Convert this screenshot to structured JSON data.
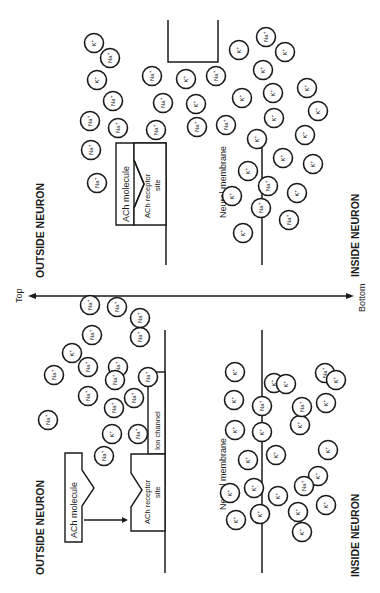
{
  "axis": {
    "top_label": "Top",
    "bottom_label": "Bottom"
  },
  "panel_closed": {
    "outside_label": "OUTSIDE NEURON",
    "inside_label": "INSIDE NEURON",
    "ach_molecule_label": "ACh molecule",
    "receptor_label_line1": "ACh receptor",
    "receptor_label_line2": "site",
    "ion_channel_label": "Ion channel",
    "membrane_label": "Neural membrane",
    "ions": [
      {
        "x": 48,
        "y": 420,
        "t": "Na"
      },
      {
        "x": 54,
        "y": 375,
        "t": "Na"
      },
      {
        "x": 72,
        "y": 353,
        "t": "K"
      },
      {
        "x": 88,
        "y": 396,
        "t": "Na"
      },
      {
        "x": 92,
        "y": 335,
        "t": "Na"
      },
      {
        "x": 117,
        "y": 307,
        "t": "Na"
      },
      {
        "x": 104,
        "y": 456,
        "t": "Na"
      },
      {
        "x": 112,
        "y": 434,
        "t": "K"
      },
      {
        "x": 114,
        "y": 408,
        "t": "Na"
      },
      {
        "x": 118,
        "y": 367,
        "t": "Na"
      },
      {
        "x": 90,
        "y": 305,
        "t": "Na"
      },
      {
        "x": 134,
        "y": 398,
        "t": "Na"
      },
      {
        "x": 138,
        "y": 434,
        "t": "Na"
      },
      {
        "x": 140,
        "y": 337,
        "t": "Na"
      },
      {
        "x": 115,
        "y": 380,
        "t": "Na"
      },
      {
        "x": 88,
        "y": 367,
        "t": "Na"
      },
      {
        "x": 140,
        "y": 318,
        "t": "Na"
      },
      {
        "x": 148,
        "y": 377,
        "t": "Na"
      },
      {
        "x": 235,
        "y": 372,
        "t": "K"
      },
      {
        "x": 234,
        "y": 400,
        "t": "K"
      },
      {
        "x": 262,
        "y": 406,
        "t": "Na"
      },
      {
        "x": 274,
        "y": 383,
        "t": "K"
      },
      {
        "x": 286,
        "y": 384,
        "t": "K"
      },
      {
        "x": 235,
        "y": 430,
        "t": "K"
      },
      {
        "x": 248,
        "y": 460,
        "t": "K"
      },
      {
        "x": 262,
        "y": 432,
        "t": "K"
      },
      {
        "x": 276,
        "y": 455,
        "t": "K"
      },
      {
        "x": 300,
        "y": 425,
        "t": "K"
      },
      {
        "x": 302,
        "y": 407,
        "t": "Na"
      },
      {
        "x": 325,
        "y": 373,
        "t": "Na"
      },
      {
        "x": 326,
        "y": 403,
        "t": "K"
      },
      {
        "x": 336,
        "y": 380,
        "t": "K"
      },
      {
        "x": 328,
        "y": 450,
        "t": "K"
      },
      {
        "x": 318,
        "y": 476,
        "t": "K"
      },
      {
        "x": 326,
        "y": 505,
        "t": "K"
      },
      {
        "x": 298,
        "y": 512,
        "t": "K"
      },
      {
        "x": 304,
        "y": 486,
        "t": "Na"
      },
      {
        "x": 278,
        "y": 496,
        "t": "K"
      },
      {
        "x": 260,
        "y": 514,
        "t": "K"
      },
      {
        "x": 254,
        "y": 488,
        "t": "K"
      },
      {
        "x": 236,
        "y": 520,
        "t": "K"
      },
      {
        "x": 230,
        "y": 493,
        "t": "K"
      },
      {
        "x": 302,
        "y": 532,
        "t": "K"
      }
    ]
  },
  "panel_open": {
    "outside_label": "OUTSIDE NEURON",
    "inside_label": "INSIDE NEURON",
    "ach_molecule_label": "ACh molecule",
    "receptor_label_line1": "ACh receptor",
    "receptor_label_line2": "site",
    "membrane_label": "Neural membrane",
    "ions": [
      {
        "x": 97,
        "y": 183,
        "t": "Na"
      },
      {
        "x": 91,
        "y": 150,
        "t": "Na"
      },
      {
        "x": 90,
        "y": 121,
        "t": "Na"
      },
      {
        "x": 97,
        "y": 80,
        "t": "K"
      },
      {
        "x": 113,
        "y": 101,
        "t": "Na"
      },
      {
        "x": 118,
        "y": 128,
        "t": "Na"
      },
      {
        "x": 110,
        "y": 58,
        "t": "Na"
      },
      {
        "x": 94,
        "y": 43,
        "t": "K"
      },
      {
        "x": 152,
        "y": 76,
        "t": "Na"
      },
      {
        "x": 163,
        "y": 103,
        "t": "Na"
      },
      {
        "x": 156,
        "y": 130,
        "t": "Na"
      },
      {
        "x": 186,
        "y": 79,
        "t": "K"
      },
      {
        "x": 196,
        "y": 104,
        "t": "K"
      },
      {
        "x": 197,
        "y": 127,
        "t": "Na"
      },
      {
        "x": 216,
        "y": 76,
        "t": "Na"
      },
      {
        "x": 226,
        "y": 125,
        "t": "Na"
      },
      {
        "x": 239,
        "y": 50,
        "t": "K"
      },
      {
        "x": 266,
        "y": 37,
        "t": "Na"
      },
      {
        "x": 285,
        "y": 52,
        "t": "K"
      },
      {
        "x": 263,
        "y": 70,
        "t": "K"
      },
      {
        "x": 242,
        "y": 98,
        "t": "K"
      },
      {
        "x": 273,
        "y": 93,
        "t": "K"
      },
      {
        "x": 307,
        "y": 88,
        "t": "K"
      },
      {
        "x": 318,
        "y": 111,
        "t": "K"
      },
      {
        "x": 274,
        "y": 118,
        "t": "K"
      },
      {
        "x": 257,
        "y": 139,
        "t": "K"
      },
      {
        "x": 305,
        "y": 135,
        "t": "K"
      },
      {
        "x": 283,
        "y": 158,
        "t": "K"
      },
      {
        "x": 248,
        "y": 171,
        "t": "K"
      },
      {
        "x": 313,
        "y": 164,
        "t": "K"
      },
      {
        "x": 268,
        "y": 186,
        "t": "Na"
      },
      {
        "x": 232,
        "y": 196,
        "t": "K"
      },
      {
        "x": 297,
        "y": 193,
        "t": "K"
      },
      {
        "x": 261,
        "y": 208,
        "t": "Na"
      },
      {
        "x": 289,
        "y": 220,
        "t": "Na"
      },
      {
        "x": 243,
        "y": 233,
        "t": "K"
      }
    ]
  }
}
